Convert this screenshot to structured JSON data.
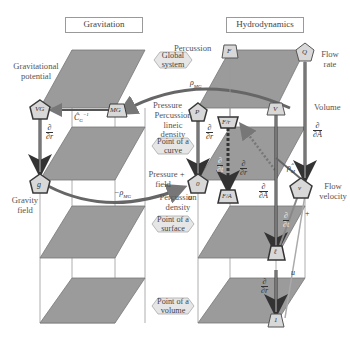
{
  "panels": {
    "left_title": "Gravitation",
    "right_title": "Hydrodynamics"
  },
  "hex_labels": [
    {
      "id": "global",
      "text": "Global system"
    },
    {
      "id": "curve",
      "text": "Point of a curve"
    },
    {
      "id": "surface",
      "text": "Point of a surface"
    },
    {
      "id": "volume",
      "text": "Point of a volume"
    }
  ],
  "labels": {
    "grav_potential": "Gravitational potential",
    "gravity_field": "Gravity field",
    "percussion": "Percussion",
    "flow_rate": "Flow rate",
    "pressure": "Pressure",
    "percussion_lineic_density": "Percussion lineic density",
    "pressure_field": "Pressure field",
    "percussion_density": "Percussion density",
    "volume": "Volume",
    "flow_velocity": "Flow velocity"
  },
  "nodes": {
    "VG": "VG",
    "MG": "MG",
    "g": "g",
    "F": "F",
    "Q": "Q",
    "P": "P",
    "V": "V",
    "Fr": "F/r",
    "zero": "0",
    "FA": "F/A",
    "v": "v",
    "l": "ℓ",
    "one": "1"
  },
  "symbols": {
    "CG_inv": "Ĉ",
    "CG_sub": "G",
    "CG_sup": "−1",
    "rho_MG": "ρ",
    "rho_MG_sub": "MG",
    "neg_rho_MG": "−ρ",
    "rho_M": "ρ̂",
    "rho_M_sub": "M",
    "u": "u",
    "plus": "+",
    "d": "∂",
    "dr": "∂r",
    "dA": "∂A",
    "dt": "∂t"
  },
  "colors": {
    "plane": "#9b9b9b",
    "plane_dark": "#8a8a8a",
    "arrow": "#6e6e6e",
    "node_fill": "#d8d8d8",
    "node_dark": "#3a3a3a",
    "hex_fill": "#e6e6e6"
  }
}
